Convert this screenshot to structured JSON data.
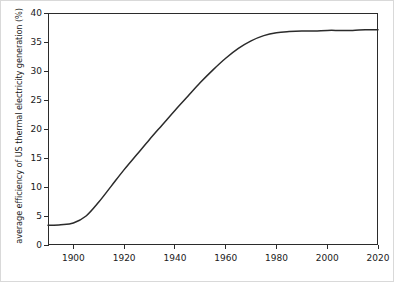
{
  "chart_data": {
    "type": "line",
    "title": "",
    "xlabel": "",
    "ylabel": "average efficiency of US thermal electricity generation  (%)",
    "xlim": [
      1890,
      2020
    ],
    "ylim": [
      0,
      40
    ],
    "xticks": [
      1900,
      1920,
      1940,
      1960,
      1980,
      2000,
      2020
    ],
    "xtick_labels": [
      "1900",
      "1920",
      "1940",
      "1960",
      "1980",
      "2000",
      "2020"
    ],
    "yticks": [
      0,
      5,
      10,
      15,
      20,
      25,
      30,
      35,
      40
    ],
    "ytick_labels": [
      "0",
      "5",
      "10",
      "15",
      "20",
      "25",
      "30",
      "35",
      "40"
    ],
    "grid": false,
    "legend": false,
    "line_color": "#2b2b2b",
    "background_color": "#ffffff",
    "series": [
      {
        "name": "average efficiency of US thermal electricity generation",
        "x": [
          1890,
          1895,
          1900,
          1905,
          1910,
          1915,
          1920,
          1925,
          1930,
          1935,
          1940,
          1945,
          1950,
          1955,
          1960,
          1965,
          1970,
          1975,
          1980,
          1985,
          1990,
          1995,
          2000,
          2005,
          2010,
          2015,
          2020
        ],
        "values": [
          3.4,
          3.5,
          3.8,
          5.0,
          7.4,
          10.2,
          13.0,
          15.6,
          18.2,
          20.7,
          23.2,
          25.6,
          28.0,
          30.2,
          32.2,
          33.9,
          35.2,
          36.1,
          36.6,
          36.8,
          36.9,
          36.9,
          37.0,
          37.0,
          37.0,
          37.1,
          37.1
        ]
      }
    ]
  }
}
